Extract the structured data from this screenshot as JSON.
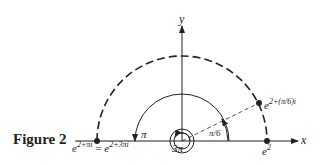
{
  "figure": {
    "caption": "Figure 2",
    "axes": {
      "x_label": "x",
      "y_label": "y"
    },
    "angles": {
      "pi": "π",
      "three_pi": "3π",
      "pi_over_6": "π/6"
    },
    "points": {
      "left": {
        "base": "e",
        "exp_left": "2+πi",
        "equals": "=",
        "exp_right": "2+3πi"
      },
      "right": {
        "base": "e",
        "exp": "2"
      },
      "upper": {
        "base": "e",
        "exp": "2+(π/6)i"
      }
    },
    "colors": {
      "stroke": "#222222",
      "background": "#ffffff"
    }
  }
}
